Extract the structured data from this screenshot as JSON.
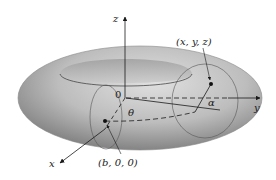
{
  "figure": {
    "type": "torus-coordinate-diagram",
    "axes": {
      "x_label": "x",
      "y_label": "y",
      "z_label": "z",
      "origin_label": "0"
    },
    "angles": {
      "theta_label": "θ",
      "alpha_label": "α"
    },
    "points": [
      {
        "name": "point-on-surface",
        "label": "(x, y, z)"
      },
      {
        "name": "tube-center",
        "label": "(b, 0, 0)"
      }
    ],
    "colors": {
      "torus_light": "#d4d4d4",
      "torus_mid": "#a9a9a9",
      "torus_dark": "#7e7e7e",
      "line": "#1a1a1a",
      "background": "#ffffff"
    }
  }
}
